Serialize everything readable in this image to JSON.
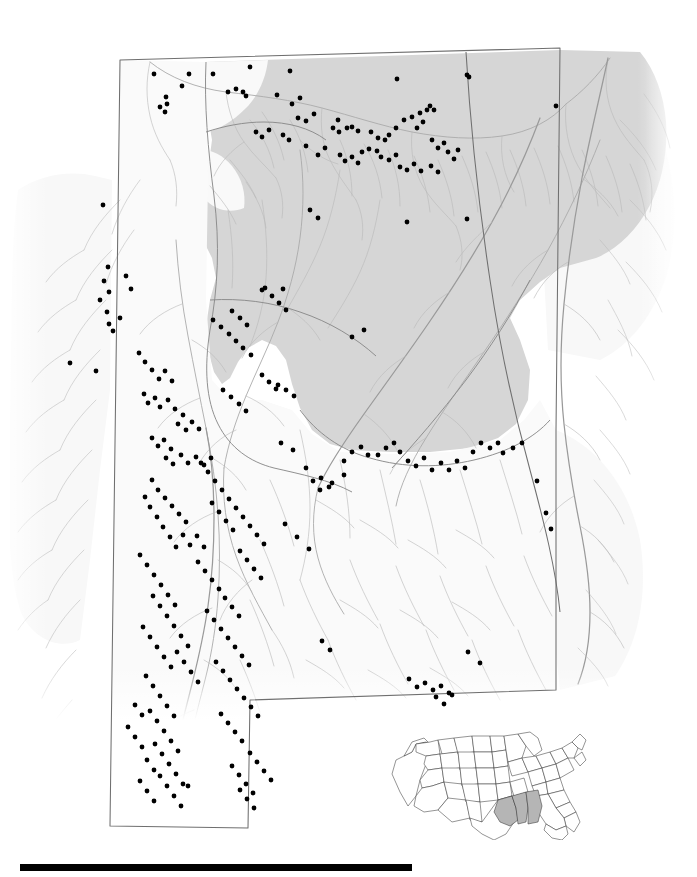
{
  "figure": {
    "kind": "species-distribution-map",
    "region_title": "Alabama",
    "caption": "",
    "background_color": "#ffffff"
  },
  "colors": {
    "highland_shade": "#d6d6d6",
    "lowland_shade": "#f7f7f7",
    "river_line": "#b9b9b9",
    "major_river_line": "#9a9a9a",
    "boundary_line": "#6f6f6f",
    "locality_dot": "#000000",
    "inset_highlight": "#b5b5b5",
    "inset_outline": "#2b2b2b",
    "scalebar": "#000000"
  },
  "main_map": {
    "name": "alabama-distribution-map",
    "shaded_province_label": "Appalachian Highlands (shaded)",
    "unshaded_province_label": "Coastal Plain (unshaded)",
    "locality_dot_radius_px": 2.4,
    "locality_count": 299,
    "localities": [
      [
        154,
        74
      ],
      [
        189,
        74
      ],
      [
        213,
        74
      ],
      [
        250,
        67
      ],
      [
        290,
        71
      ],
      [
        397,
        79
      ],
      [
        467,
        75
      ],
      [
        469,
        77
      ],
      [
        182,
        86
      ],
      [
        228,
        92
      ],
      [
        236,
        89
      ],
      [
        243,
        92
      ],
      [
        246,
        96
      ],
      [
        277,
        95
      ],
      [
        292,
        104
      ],
      [
        300,
        98
      ],
      [
        166,
        97
      ],
      [
        167,
        104
      ],
      [
        160,
        107
      ],
      [
        165,
        112
      ],
      [
        298,
        118
      ],
      [
        306,
        121
      ],
      [
        314,
        114
      ],
      [
        338,
        120
      ],
      [
        347,
        128
      ],
      [
        352,
        127
      ],
      [
        358,
        131
      ],
      [
        339,
        132
      ],
      [
        333,
        128
      ],
      [
        371,
        132
      ],
      [
        378,
        138
      ],
      [
        385,
        140
      ],
      [
        389,
        135
      ],
      [
        396,
        128
      ],
      [
        404,
        120
      ],
      [
        412,
        117
      ],
      [
        420,
        113
      ],
      [
        427,
        110
      ],
      [
        430,
        106
      ],
      [
        434,
        110
      ],
      [
        423,
        122
      ],
      [
        417,
        128
      ],
      [
        432,
        140
      ],
      [
        438,
        148
      ],
      [
        444,
        143
      ],
      [
        448,
        152
      ],
      [
        454,
        159
      ],
      [
        458,
        150
      ],
      [
        362,
        152
      ],
      [
        369,
        149
      ],
      [
        377,
        151
      ],
      [
        381,
        157
      ],
      [
        389,
        160
      ],
      [
        396,
        155
      ],
      [
        340,
        155
      ],
      [
        345,
        161
      ],
      [
        352,
        157
      ],
      [
        358,
        163
      ],
      [
        325,
        148
      ],
      [
        318,
        155
      ],
      [
        306,
        146
      ],
      [
        289,
        140
      ],
      [
        283,
        135
      ],
      [
        269,
        130
      ],
      [
        262,
        137
      ],
      [
        256,
        132
      ],
      [
        400,
        167
      ],
      [
        407,
        170
      ],
      [
        414,
        164
      ],
      [
        421,
        171
      ],
      [
        431,
        166
      ],
      [
        438,
        172
      ],
      [
        103,
        205
      ],
      [
        108,
        267
      ],
      [
        104,
        281
      ],
      [
        109,
        292
      ],
      [
        100,
        300
      ],
      [
        107,
        312
      ],
      [
        126,
        276
      ],
      [
        131,
        289
      ],
      [
        120,
        318
      ],
      [
        109,
        324
      ],
      [
        113,
        331
      ],
      [
        70,
        363
      ],
      [
        96,
        371
      ],
      [
        139,
        353
      ],
      [
        145,
        362
      ],
      [
        152,
        370
      ],
      [
        159,
        379
      ],
      [
        165,
        371
      ],
      [
        172,
        381
      ],
      [
        144,
        394
      ],
      [
        148,
        403
      ],
      [
        155,
        398
      ],
      [
        160,
        407
      ],
      [
        168,
        400
      ],
      [
        175,
        409
      ],
      [
        183,
        415
      ],
      [
        178,
        424
      ],
      [
        186,
        430
      ],
      [
        192,
        422
      ],
      [
        199,
        429
      ],
      [
        152,
        438
      ],
      [
        158,
        446
      ],
      [
        164,
        440
      ],
      [
        171,
        449
      ],
      [
        166,
        458
      ],
      [
        173,
        464
      ],
      [
        181,
        455
      ],
      [
        188,
        463
      ],
      [
        196,
        457
      ],
      [
        204,
        465
      ],
      [
        211,
        458
      ],
      [
        213,
        320
      ],
      [
        221,
        327
      ],
      [
        229,
        334
      ],
      [
        236,
        341
      ],
      [
        243,
        348
      ],
      [
        251,
        355
      ],
      [
        232,
        311
      ],
      [
        240,
        318
      ],
      [
        247,
        325
      ],
      [
        265,
        288
      ],
      [
        272,
        296
      ],
      [
        279,
        303
      ],
      [
        286,
        310
      ],
      [
        223,
        390
      ],
      [
        231,
        397
      ],
      [
        239,
        404
      ],
      [
        246,
        411
      ],
      [
        262,
        375
      ],
      [
        269,
        382
      ],
      [
        276,
        389
      ],
      [
        152,
        480
      ],
      [
        158,
        490
      ],
      [
        165,
        498
      ],
      [
        172,
        506
      ],
      [
        179,
        514
      ],
      [
        186,
        522
      ],
      [
        145,
        497
      ],
      [
        150,
        507
      ],
      [
        157,
        517
      ],
      [
        163,
        527
      ],
      [
        170,
        537
      ],
      [
        176,
        547
      ],
      [
        183,
        535
      ],
      [
        190,
        545
      ],
      [
        197,
        536
      ],
      [
        204,
        547
      ],
      [
        140,
        555
      ],
      [
        147,
        565
      ],
      [
        154,
        575
      ],
      [
        161,
        585
      ],
      [
        168,
        595
      ],
      [
        175,
        605
      ],
      [
        153,
        596
      ],
      [
        160,
        606
      ],
      [
        167,
        616
      ],
      [
        174,
        626
      ],
      [
        181,
        636
      ],
      [
        188,
        646
      ],
      [
        143,
        627
      ],
      [
        150,
        637
      ],
      [
        157,
        647
      ],
      [
        164,
        657
      ],
      [
        171,
        667
      ],
      [
        177,
        652
      ],
      [
        184,
        662
      ],
      [
        191,
        672
      ],
      [
        198,
        682
      ],
      [
        146,
        676
      ],
      [
        153,
        686
      ],
      [
        160,
        696
      ],
      [
        167,
        706
      ],
      [
        174,
        716
      ],
      [
        150,
        711
      ],
      [
        157,
        721
      ],
      [
        164,
        731
      ],
      [
        171,
        741
      ],
      [
        178,
        751
      ],
      [
        155,
        744
      ],
      [
        162,
        754
      ],
      [
        169,
        764
      ],
      [
        176,
        774
      ],
      [
        183,
        784
      ],
      [
        160,
        776
      ],
      [
        167,
        786
      ],
      [
        174,
        796
      ],
      [
        181,
        806
      ],
      [
        188,
        786
      ],
      [
        135,
        705
      ],
      [
        142,
        715
      ],
      [
        128,
        727
      ],
      [
        135,
        737
      ],
      [
        142,
        747
      ],
      [
        147,
        760
      ],
      [
        154,
        770
      ],
      [
        140,
        781
      ],
      [
        147,
        791
      ],
      [
        154,
        801
      ],
      [
        201,
        463
      ],
      [
        208,
        472
      ],
      [
        215,
        481
      ],
      [
        222,
        490
      ],
      [
        229,
        499
      ],
      [
        236,
        508
      ],
      [
        243,
        517
      ],
      [
        250,
        526
      ],
      [
        257,
        535
      ],
      [
        264,
        544
      ],
      [
        212,
        503
      ],
      [
        219,
        512
      ],
      [
        226,
        521
      ],
      [
        233,
        530
      ],
      [
        240,
        551
      ],
      [
        247,
        560
      ],
      [
        254,
        569
      ],
      [
        261,
        578
      ],
      [
        198,
        562
      ],
      [
        205,
        571
      ],
      [
        212,
        580
      ],
      [
        219,
        589
      ],
      [
        225,
        598
      ],
      [
        232,
        607
      ],
      [
        239,
        616
      ],
      [
        207,
        611
      ],
      [
        214,
        620
      ],
      [
        221,
        629
      ],
      [
        228,
        638
      ],
      [
        235,
        647
      ],
      [
        242,
        656
      ],
      [
        249,
        665
      ],
      [
        216,
        662
      ],
      [
        223,
        671
      ],
      [
        230,
        680
      ],
      [
        237,
        689
      ],
      [
        244,
        698
      ],
      [
        251,
        707
      ],
      [
        258,
        716
      ],
      [
        221,
        714
      ],
      [
        228,
        723
      ],
      [
        235,
        732
      ],
      [
        242,
        741
      ],
      [
        250,
        753
      ],
      [
        257,
        762
      ],
      [
        264,
        771
      ],
      [
        271,
        780
      ],
      [
        232,
        766
      ],
      [
        239,
        775
      ],
      [
        246,
        784
      ],
      [
        253,
        793
      ],
      [
        240,
        790
      ],
      [
        247,
        799
      ],
      [
        254,
        808
      ],
      [
        278,
        385
      ],
      [
        286,
        390
      ],
      [
        294,
        396
      ],
      [
        281,
        443
      ],
      [
        293,
        450
      ],
      [
        306,
        468
      ],
      [
        313,
        481
      ],
      [
        320,
        490
      ],
      [
        332,
        483
      ],
      [
        344,
        475
      ],
      [
        285,
        524
      ],
      [
        297,
        537
      ],
      [
        309,
        549
      ],
      [
        322,
        641
      ],
      [
        330,
        650
      ],
      [
        344,
        461
      ],
      [
        352,
        452
      ],
      [
        361,
        447
      ],
      [
        368,
        455
      ],
      [
        378,
        455
      ],
      [
        386,
        448
      ],
      [
        394,
        443
      ],
      [
        400,
        452
      ],
      [
        408,
        461
      ],
      [
        416,
        466
      ],
      [
        424,
        458
      ],
      [
        432,
        470
      ],
      [
        441,
        463
      ],
      [
        449,
        470
      ],
      [
        457,
        461
      ],
      [
        465,
        468
      ],
      [
        473,
        452
      ],
      [
        481,
        443
      ],
      [
        490,
        448
      ],
      [
        498,
        443
      ],
      [
        503,
        453
      ],
      [
        513,
        448
      ],
      [
        522,
        443
      ],
      [
        537,
        481
      ],
      [
        546,
        513
      ],
      [
        551,
        529
      ],
      [
        468,
        652
      ],
      [
        480,
        663
      ],
      [
        409,
        679
      ],
      [
        417,
        687
      ],
      [
        425,
        683
      ],
      [
        433,
        690
      ],
      [
        441,
        686
      ],
      [
        449,
        693
      ],
      [
        436,
        697
      ],
      [
        444,
        704
      ],
      [
        452,
        695
      ],
      [
        364,
        330
      ],
      [
        352,
        337
      ],
      [
        283,
        289
      ],
      [
        262,
        290
      ],
      [
        321,
        478
      ],
      [
        329,
        487
      ],
      [
        407,
        222
      ],
      [
        467,
        219
      ],
      [
        556,
        106
      ],
      [
        310,
        210
      ],
      [
        318,
        218
      ]
    ]
  },
  "inset_map": {
    "name": "us-inset-map",
    "title": "",
    "highlighted_states": [
      "Louisiana",
      "Mississippi",
      "Alabama"
    ],
    "bbox_px": [
      386,
      730,
      204,
      110
    ]
  },
  "scale_bar": {
    "name": "scale-bar",
    "label": "",
    "x_px": 20,
    "y_px": 864,
    "width_px": 392,
    "height_px": 7
  }
}
